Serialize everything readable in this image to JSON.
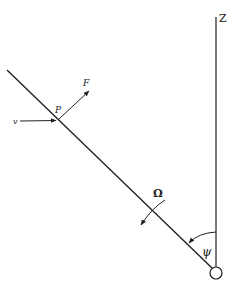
{
  "diagram": {
    "type": "rotating-line-geometry",
    "labels": {
      "z_axis": "Z",
      "point": "P",
      "force": "F",
      "velocity": "v",
      "angular_velocity": "Ω",
      "angle": "ψ"
    },
    "elements": [
      {
        "name": "vertical-z-axis",
        "from": [
          216,
          17
        ],
        "to": [
          216,
          268
        ]
      },
      {
        "name": "inclined-line",
        "from": [
          7,
          70
        ],
        "to": [
          212,
          268
        ]
      },
      {
        "name": "velocity-arrow",
        "from": [
          20,
          121
        ],
        "to": [
          57,
          120
        ]
      },
      {
        "name": "force-arrow",
        "from": [
          59,
          119
        ],
        "to": [
          90,
          90
        ]
      },
      {
        "name": "omega-rotation-arrow",
        "center_crossing": [
          152,
          210
        ]
      },
      {
        "name": "psi-angle-arc",
        "between": [
          "vertical-z-axis",
          "inclined-line"
        ]
      },
      {
        "name": "pivot-circle",
        "center": [
          216,
          273
        ],
        "r": 6
      }
    ],
    "colors": {
      "stroke": "#222222",
      "background": "#ffffff"
    }
  }
}
